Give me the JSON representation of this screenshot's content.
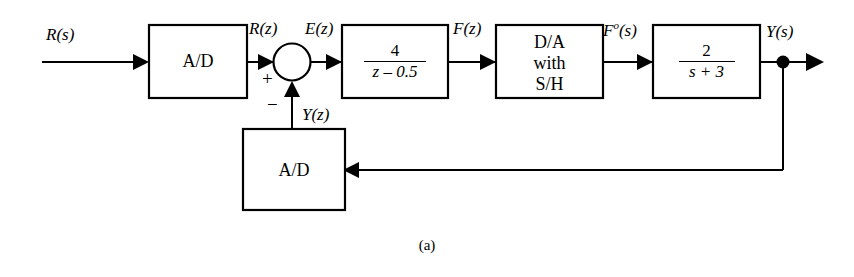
{
  "figure": {
    "caption": "(a)",
    "type": "control-system-block-diagram"
  },
  "signals": {
    "input": "R(s)",
    "after_input_ad": "R(z)",
    "error": "E(z)",
    "after_controller": "F(z)",
    "after_da": {
      "base": "F",
      "superscript": "o",
      "arg": "(s)"
    },
    "output": "Y(s)",
    "feedback": "Y(z)"
  },
  "summing_junction": {
    "plus_sign": "+",
    "minus_sign": "−"
  },
  "blocks": {
    "input_ad": {
      "label": "A/D"
    },
    "controller": {
      "numerator": "4",
      "denominator": "z – 0.5"
    },
    "da_sh": {
      "line1": "D/A",
      "line2": "with",
      "line3": "S/H"
    },
    "plant": {
      "numerator": "2",
      "denominator": "s + 3"
    },
    "feedback_ad": {
      "label": "A/D"
    }
  },
  "colors": {
    "line": "#000000",
    "background": "#ffffff",
    "text": "#000000"
  }
}
